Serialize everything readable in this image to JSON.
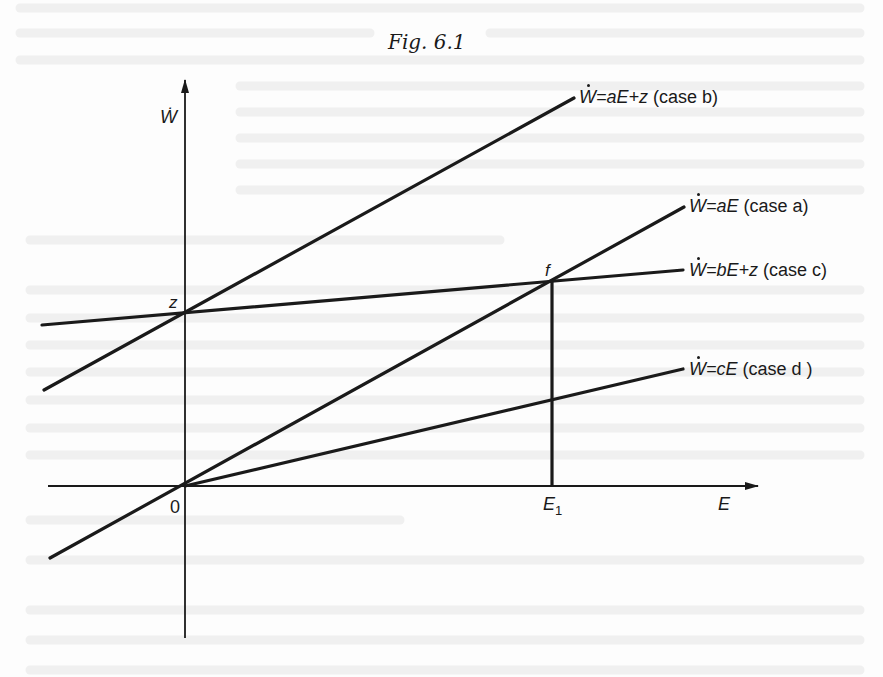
{
  "figure": {
    "title": "Fig. 6.1"
  },
  "axes": {
    "y_label": "Ẇ",
    "x_label": "E",
    "origin_label": "0"
  },
  "points": {
    "z": "z",
    "f": "f",
    "e1_main": "E",
    "e1_sub": "1"
  },
  "lines": [
    {
      "id": "case-b",
      "w": "W",
      "rhs": "=aE+z",
      "case": "(case b)",
      "color": "#1a1a1a"
    },
    {
      "id": "case-a",
      "w": "W",
      "rhs": "=aE",
      "case": "(case a)",
      "color": "#1a1a1a"
    },
    {
      "id": "case-c",
      "w": "W",
      "rhs": "=bE+z",
      "case": "(case c)",
      "color": "#1a1a1a"
    },
    {
      "id": "case-d",
      "w": "W",
      "rhs": "=cE",
      "case": "(case d )",
      "color": "#1a1a1a"
    }
  ],
  "colors": {
    "ink": "#1a1a1a",
    "paper": "#fdfdfd",
    "showthrough": "#ececec"
  }
}
